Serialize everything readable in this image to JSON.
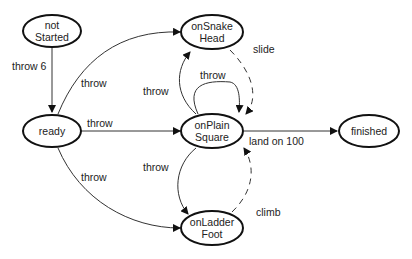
{
  "nodes": {
    "notStarted": {
      "line1": "not",
      "line2": "Started"
    },
    "ready": {
      "line1": "ready"
    },
    "onSnakeHead": {
      "line1": "onSnake",
      "line2": "Head"
    },
    "onPlainSquare": {
      "line1": "onPlain",
      "line2": "Square"
    },
    "onLadderFoot": {
      "line1": "onLadder",
      "line2": "Foot"
    },
    "finished": {
      "line1": "finished"
    }
  },
  "edges": {
    "notStarted_ready": "throw 6",
    "ready_snake": "throw",
    "ready_plain": "throw",
    "ready_ladder": "throw",
    "plain_snake": "throw",
    "plain_self": "throw",
    "plain_ladder": "throw",
    "snake_plain": "slide",
    "ladder_plain": "climb",
    "plain_finished": "land on 100"
  },
  "colors": {
    "stroke": "#111111",
    "background": "#ffffff"
  }
}
